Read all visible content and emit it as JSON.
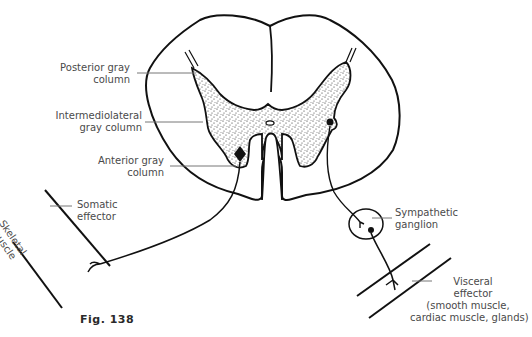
{
  "figure": {
    "caption": "Fig. 138",
    "colors": {
      "ink": "#111111",
      "label_text": "#4a4a4a",
      "leader_line": "#777777",
      "background": "#ffffff"
    }
  },
  "labels": {
    "posterior_gray_column": {
      "line1": "Posterior gray",
      "line2": "column"
    },
    "intermediolateral_gray_column": {
      "line1": "Intermediolateral",
      "line2": "gray column"
    },
    "anterior_gray_column": {
      "line1": "Anterior gray",
      "line2": "column"
    },
    "somatic_effector": {
      "line1": "Somatic",
      "line2": "effector"
    },
    "skeletal_muscle": {
      "line1": "Skeletal",
      "line2": "muscle"
    },
    "sympathetic_ganglion": {
      "line1": "Sympathetic",
      "line2": "ganglion"
    },
    "visceral_effector": {
      "line1": "Visceral",
      "line2": "effector",
      "line3": "(smooth muscle,",
      "line4": "cardiac muscle, glands)"
    }
  }
}
